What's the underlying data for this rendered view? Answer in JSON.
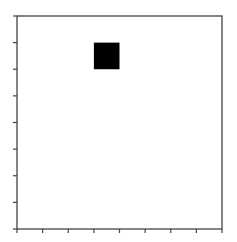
{
  "chart_data": {
    "type": "heatmap",
    "title": "",
    "xlabel": "",
    "ylabel": "",
    "grid": false,
    "legend": null,
    "xlim": [
      0,
      8
    ],
    "ylim": [
      0,
      8
    ],
    "x_ticks": [
      0,
      1,
      2,
      3,
      4,
      5,
      6,
      7,
      8
    ],
    "y_ticks": [
      0,
      1,
      2,
      3,
      4,
      5,
      6,
      7,
      8
    ],
    "x_tick_labels": [],
    "y_tick_labels": [],
    "cells": [
      {
        "x": 3,
        "y": 6,
        "width": 1,
        "height": 1,
        "value": 1,
        "color": "#000000"
      }
    ],
    "background": "#ffffff",
    "axis_color": "#444444"
  }
}
